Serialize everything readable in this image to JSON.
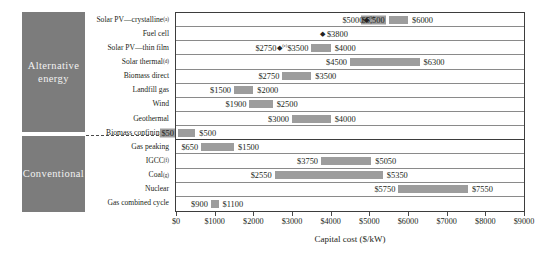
{
  "chart_data": {
    "type": "bar",
    "orientation": "horizontal",
    "title": "",
    "xlabel": "Capital cost ($/kW)",
    "ylabel": "",
    "xlim": [
      0,
      9000
    ],
    "xticks": [
      "$0",
      "$1000",
      "$2000",
      "$3000",
      "$4000",
      "$5000",
      "$6000",
      "$7000",
      "$8000",
      "$9000"
    ],
    "xtick_values": [
      0,
      1000,
      2000,
      3000,
      4000,
      5000,
      6000,
      7000,
      8000,
      9000
    ],
    "grid": true,
    "legend": "none",
    "bar_color": "#9d9d9d",
    "group_panel_color": "#7c7c7c",
    "groups": [
      {
        "name": "Alternative energy",
        "label": "Alternative\nenergy",
        "count": 9
      },
      {
        "name": "Conventional",
        "label": "Conventional",
        "count": 5
      }
    ],
    "categories": [
      "Solar PV—crystalline",
      "Fuel cell",
      "Solar PV—thin film",
      "Solar thermal",
      "Biomass direct",
      "Landfill gas",
      "Wind",
      "Geothermal",
      "Biomass confining",
      "Gas peaking",
      "IGCC",
      "Coal",
      "Nuclear",
      "Gas combined cycle"
    ],
    "category_footnotes": [
      "(a)",
      "",
      "",
      "(d)",
      "",
      "",
      "",
      "",
      "(e)",
      "",
      "(f)",
      "(g)",
      "",
      ""
    ],
    "rows": [
      {
        "label": "Solar PV—crystalline",
        "footnote": "(a)",
        "group": "Alternative energy",
        "low": 5500,
        "high": 6000,
        "low_text": "$5,500",
        "high_text": "$6000",
        "marker": 5000,
        "marker_text": "$5000",
        "marker_footnote": "(b)",
        "highlight_low": true
      },
      {
        "label": "Fuel cell",
        "footnote": "",
        "group": "Alternative energy",
        "low": null,
        "high": null,
        "low_text": "",
        "high_text": "$3800",
        "marker": 3800,
        "marker_text": "",
        "marker_footnote": ""
      },
      {
        "label": "Solar PV—thin film",
        "footnote": "",
        "group": "Alternative energy",
        "low": 3500,
        "high": 4000,
        "low_text": "$3500",
        "high_text": "$4000",
        "marker": 2750,
        "marker_text": "$2750",
        "marker_footnote": "(c)"
      },
      {
        "label": "Solar thermal",
        "footnote": "(d)",
        "group": "Alternative energy",
        "low": 4500,
        "high": 6300,
        "low_text": "$4500",
        "high_text": "$6300",
        "marker": null,
        "marker_text": "",
        "marker_footnote": ""
      },
      {
        "label": "Biomass direct",
        "footnote": "",
        "group": "Alternative energy",
        "low": 2750,
        "high": 3500,
        "low_text": "$2750",
        "high_text": "$3500",
        "marker": null,
        "marker_text": "",
        "marker_footnote": ""
      },
      {
        "label": "Landfill gas",
        "footnote": "",
        "group": "Alternative energy",
        "low": 1500,
        "high": 2000,
        "low_text": "$1500",
        "high_text": "$2000",
        "marker": null,
        "marker_text": "",
        "marker_footnote": ""
      },
      {
        "label": "Wind",
        "footnote": "",
        "group": "Alternative energy",
        "low": 1900,
        "high": 2500,
        "low_text": "$1900",
        "high_text": "$2500",
        "marker": null,
        "marker_text": "",
        "marker_footnote": ""
      },
      {
        "label": "Geothermal",
        "footnote": "",
        "group": "Alternative energy",
        "low": 3000,
        "high": 4000,
        "low_text": "$3000",
        "high_text": "$4000",
        "marker": null,
        "marker_text": "",
        "marker_footnote": ""
      },
      {
        "label": "Biomass confining",
        "footnote": "(e)",
        "group": "Alternative energy",
        "low": 50,
        "high": 500,
        "low_text": "$50",
        "high_text": "$500",
        "marker": null,
        "marker_text": "",
        "marker_footnote": "",
        "highlight_low": true
      },
      {
        "label": "Gas peaking",
        "footnote": "",
        "group": "Conventional",
        "low": 650,
        "high": 1500,
        "low_text": "$650",
        "high_text": "$1500",
        "marker": null,
        "marker_text": "",
        "marker_footnote": ""
      },
      {
        "label": "IGCC",
        "footnote": "(f)",
        "group": "Conventional",
        "low": 3750,
        "high": 5050,
        "low_text": "$3750",
        "high_text": "$5050",
        "marker": null,
        "marker_text": "",
        "marker_footnote": ""
      },
      {
        "label": "Coal",
        "footnote": "(g)",
        "group": "Conventional",
        "low": 2550,
        "high": 5350,
        "low_text": "$2550",
        "high_text": "$5350",
        "marker": null,
        "marker_text": "",
        "marker_footnote": ""
      },
      {
        "label": "Nuclear",
        "footnote": "",
        "group": "Conventional",
        "low": 5750,
        "high": 7550,
        "low_text": "$5750",
        "high_text": "$7550",
        "marker": null,
        "marker_text": "",
        "marker_footnote": ""
      },
      {
        "label": "Gas combined cycle",
        "footnote": "",
        "group": "Conventional",
        "low": 900,
        "high": 1100,
        "low_text": "$900",
        "high_text": "$1100",
        "marker": null,
        "marker_text": "",
        "marker_footnote": ""
      }
    ]
  },
  "groups": {
    "alternative": {
      "line1": "Alternative",
      "line2": "energy"
    },
    "conventional": {
      "line1": "Conventional",
      "line2": ""
    }
  },
  "axis": {
    "xlabel": "Capital cost ($/kW)"
  }
}
